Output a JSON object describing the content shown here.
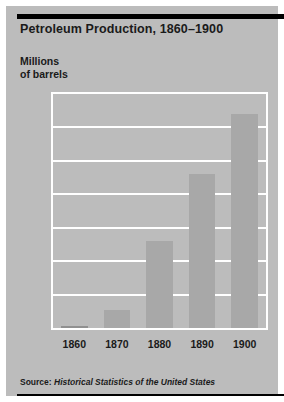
{
  "chart_data": {
    "type": "bar",
    "title": "Petroleum Production, 1860–1900",
    "xlabel": "",
    "ylabel": "Millions of barrels",
    "ylabel_line1": "Millions",
    "ylabel_line2": "of barrels",
    "categories": [
      "1860",
      "1870",
      "1880",
      "1890",
      "1900"
    ],
    "values": [
      0.5,
      5.5,
      26,
      46,
      64
    ],
    "series": [
      {
        "name": "Petroleum production (millions of barrels)",
        "values": [
          0.5,
          5.5,
          26,
          46,
          64
        ]
      }
    ],
    "ylim": [
      0,
      70
    ],
    "yticks": [
      0,
      10,
      20,
      30,
      40,
      50,
      60,
      70
    ],
    "ytick_labels": [
      "0",
      "10",
      "20",
      "30",
      "40",
      "50",
      "60",
      "70"
    ],
    "grid": true,
    "grid_color": "#ffffff",
    "legend": false,
    "legend_position": "none",
    "bar_color": "#a8a8a8",
    "plot_background": "#bcbcbc",
    "page_background": "#bcbcbc",
    "text_color": "#1a1a1a",
    "rule_color": "#000000"
  },
  "source": {
    "prefix": "Source: ",
    "title": "Historical Statistics of the United States"
  }
}
